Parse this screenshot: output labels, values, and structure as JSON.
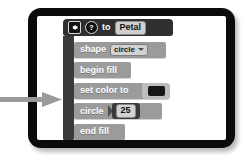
{
  "device": {
    "name": "tablet",
    "bezel_color": "#0b0b0b",
    "screen_color": "#ffffff"
  },
  "annotation": {
    "arrow": {
      "icon": "arrow-right-icon",
      "color": "#9a9a9a",
      "points_to": "circle-block"
    }
  },
  "editor": {
    "definition": {
      "gear_icon": "gear-icon",
      "help_icon": "question-mark-icon",
      "keyword": "to",
      "procedure_name": "Petal",
      "block_color": "#2f2f2f"
    },
    "blocks": [
      {
        "id": "shape-block",
        "label": "shape",
        "input_type": "dropdown",
        "value": "circle",
        "caret_icon": "chevron-down-icon"
      },
      {
        "id": "begin-fill-block",
        "label": "begin fill",
        "input_type": "none",
        "value": ""
      },
      {
        "id": "set-color-to-block",
        "label": "set color to",
        "input_type": "color",
        "value": "#171717"
      },
      {
        "id": "circle-block",
        "label": "circle",
        "input_type": "number",
        "value": "25"
      },
      {
        "id": "end-fill-block",
        "label": "end fill",
        "input_type": "none",
        "value": ""
      }
    ],
    "colors": {
      "command_block": "#9b9b9b",
      "wrapper": "#3a3a3a",
      "hat": "#2f2f2f",
      "input_field": "#d2d2d2"
    }
  }
}
